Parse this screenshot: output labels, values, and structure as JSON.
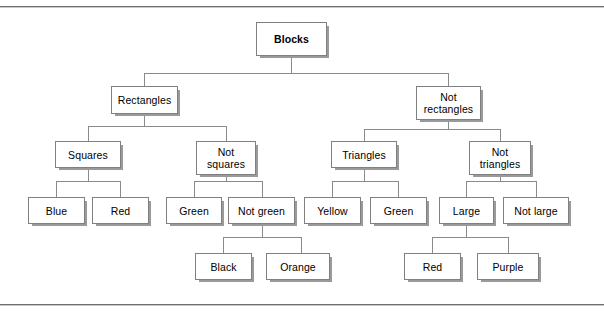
{
  "diagram": {
    "type": "hierarchy-tree",
    "style": {
      "box_fill": "#ffffff",
      "box_border": "#808080",
      "box_shadow": "#9a9a9a",
      "connector": "#8a8a8a",
      "rule": "#6d6d6d",
      "text": "#000000"
    },
    "levels": 5,
    "nodes": {
      "root": {
        "label": "Blocks",
        "bold": true
      },
      "l2": [
        {
          "label": "Rectangles"
        },
        {
          "label": "Not\nrectangles"
        }
      ],
      "l3": [
        {
          "label": "Squares"
        },
        {
          "label": "Not\nsquares"
        },
        {
          "label": "Triangles"
        },
        {
          "label": "Not\ntriangles"
        }
      ],
      "l4": [
        {
          "label": "Blue"
        },
        {
          "label": "Red"
        },
        {
          "label": "Green"
        },
        {
          "label": "Not green"
        },
        {
          "label": "Yellow"
        },
        {
          "label": "Green"
        },
        {
          "label": "Large"
        },
        {
          "label": "Not large"
        }
      ],
      "l5": [
        {
          "label": "Black"
        },
        {
          "label": "Orange"
        },
        {
          "label": "Red"
        },
        {
          "label": "Purple"
        }
      ]
    }
  }
}
